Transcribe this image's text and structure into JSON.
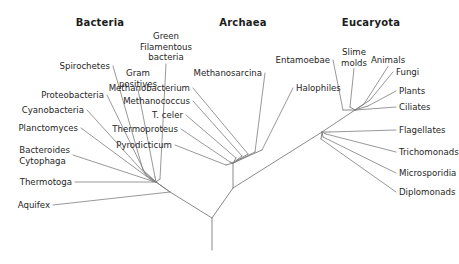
{
  "figure": {
    "name": "universal-phylogenetic-tree",
    "background_color": "#ffffff",
    "line_color": "#7d7d7d",
    "text_color": "#262626",
    "width": 459,
    "height": 264
  },
  "domains": [
    {
      "id": "bacteria",
      "label": "Bacteria",
      "x": 100,
      "y": 22
    },
    {
      "id": "archaea",
      "label": "Archaea",
      "x": 243,
      "y": 22
    },
    {
      "id": "eucaryota",
      "label": "Eucaryota",
      "x": 371,
      "y": 22
    }
  ],
  "taxa": {
    "bacteria": [
      {
        "id": "spirochetes",
        "label": "Spirochetes",
        "x": 110,
        "y": 66,
        "align": "right",
        "tip_x": 143,
        "tip_y": 170
      },
      {
        "id": "proteobacteria",
        "label": "Proteobacteria",
        "x": 104,
        "y": 95,
        "align": "right",
        "tip_x": 145,
        "tip_y": 173
      },
      {
        "id": "cyanobacteria",
        "label": "Cyanobacteria",
        "x": 84,
        "y": 110,
        "align": "right",
        "tip_x": 147,
        "tip_y": 176
      },
      {
        "id": "planctomyces",
        "label": "Planctomyces",
        "x": 78,
        "y": 128,
        "align": "right",
        "tip_x": 150,
        "tip_y": 179
      },
      {
        "id": "bacteroides",
        "label": "Bacteroides",
        "label2": "Cytophaga",
        "x": 70,
        "y": 155,
        "align": "right",
        "tip_x": 152,
        "tip_y": 181
      },
      {
        "id": "thermotoga",
        "label": "Thermotoga",
        "x": 72,
        "y": 182,
        "align": "right",
        "tip_x": 153,
        "tip_y": 182
      },
      {
        "id": "aquifex",
        "label": "Aquifex",
        "x": 50,
        "y": 205,
        "align": "right",
        "tip_x": 170,
        "tip_y": 192
      },
      {
        "id": "gram-positives",
        "label": "Gram",
        "label2": "positives",
        "x": 138,
        "y": 78,
        "align": "center",
        "tip_x": 155,
        "tip_y": 177
      },
      {
        "id": "green-filamentous-bacteria",
        "label": "Green",
        "label2": "Filamentous",
        "label3": "bacteria",
        "x": 166,
        "y": 47,
        "align": "center",
        "tip_x": 160,
        "tip_y": 179
      }
    ],
    "archaea": [
      {
        "id": "pyrodicticum",
        "label": "Pyrodicticum",
        "x": 172,
        "y": 145,
        "align": "right",
        "tip_x": 226,
        "tip_y": 165
      },
      {
        "id": "thermoproteus",
        "label": "Thermoproteus",
        "x": 178,
        "y": 129,
        "align": "right",
        "tip_x": 230,
        "tip_y": 162
      },
      {
        "id": "t-celer",
        "label": "T. celer",
        "x": 183,
        "y": 115,
        "align": "right",
        "tip_x": 236,
        "tip_y": 158
      },
      {
        "id": "methanococcus",
        "label": "Methanococcus",
        "x": 190,
        "y": 101,
        "align": "right",
        "tip_x": 242,
        "tip_y": 156
      },
      {
        "id": "methanobacterium",
        "label": "Methanobacterium",
        "x": 190,
        "y": 88,
        "align": "right",
        "tip_x": 248,
        "tip_y": 154
      },
      {
        "id": "methanosarcina",
        "label": "Methanosarcina",
        "x": 262,
        "y": 73,
        "align": "right",
        "tip_x": 255,
        "tip_y": 152
      },
      {
        "id": "halophiles",
        "label": "Halophiles",
        "x": 296,
        "y": 88,
        "align": "left",
        "tip_x": 262,
        "tip_y": 150
      }
    ],
    "eucaryota": [
      {
        "id": "entamoebae",
        "label": "Entamoebae",
        "x": 330,
        "y": 60,
        "align": "right",
        "tip_x": 343,
        "tip_y": 110
      },
      {
        "id": "slime-molds",
        "label": "Slime",
        "label2": "molds",
        "x": 354,
        "y": 57,
        "align": "center",
        "tip_x": 350,
        "tip_y": 107
      },
      {
        "id": "animals",
        "label": "Animals",
        "x": 388,
        "y": 60,
        "align": "center",
        "tip_x": 364,
        "tip_y": 104
      },
      {
        "id": "fungi",
        "label": "Fungi",
        "x": 396,
        "y": 72,
        "align": "left",
        "tip_x": 370,
        "tip_y": 100
      },
      {
        "id": "plants",
        "label": "Plants",
        "x": 399,
        "y": 91,
        "align": "left",
        "tip_x": 368,
        "tip_y": 106
      },
      {
        "id": "ciliates",
        "label": "Ciliates",
        "x": 399,
        "y": 107,
        "align": "left",
        "tip_x": 356,
        "tip_y": 110
      },
      {
        "id": "flagellates",
        "label": "Flagellates",
        "x": 399,
        "y": 130,
        "align": "left",
        "tip_x": 330,
        "tip_y": 132
      },
      {
        "id": "trichomonads",
        "label": "Trichomonads",
        "x": 399,
        "y": 152,
        "align": "left",
        "tip_x": 326,
        "tip_y": 134
      },
      {
        "id": "microsporidia",
        "label": "Microsporidia",
        "x": 399,
        "y": 173,
        "align": "left",
        "tip_x": 323,
        "tip_y": 137
      },
      {
        "id": "diplomonads",
        "label": "Diplomonads",
        "x": 399,
        "y": 192,
        "align": "left",
        "tip_x": 321,
        "tip_y": 139
      }
    ]
  },
  "nodes": {
    "root": {
      "x": 212,
      "y": 218
    },
    "root_stem_end": {
      "x": 212,
      "y": 250
    },
    "bacteria_fan": {
      "x": 156,
      "y": 182
    },
    "bacteria_base": {
      "x": 170,
      "y": 192
    },
    "archaea_node": {
      "x": 233,
      "y": 163
    },
    "archaea_base": {
      "x": 233,
      "y": 188
    },
    "euk_lower_fan": {
      "x": 322,
      "y": 132
    },
    "euk_crown": {
      "x": 355,
      "y": 110
    }
  }
}
